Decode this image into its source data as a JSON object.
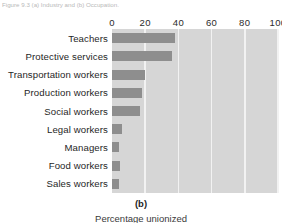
{
  "figure": {
    "caption_top": "Figure 9.3 (a) Industry and (b) Occupation.",
    "panel_label": "(b)",
    "axis_title_bottom": "Percentage unionized"
  },
  "chart_data": {
    "type": "bar",
    "orientation": "horizontal",
    "title": "",
    "subtitle": "",
    "xlabel": "Percentage unionized",
    "ylabel": "",
    "xlim": [
      0,
      100
    ],
    "xticks": [
      0,
      20,
      40,
      60,
      80,
      100
    ],
    "grid": true,
    "grid_axis": "x",
    "legend": false,
    "legend_position": "none",
    "categories": [
      "Teachers",
      "Protective services",
      "Transportation workers",
      "Production workers",
      "Social workers",
      "Legal workers",
      "Managers",
      "Food workers",
      "Sales workers"
    ],
    "values": [
      38,
      36,
      20,
      18,
      17,
      6,
      4,
      5,
      4
    ],
    "series": [
      {
        "name": "Percentage unionized",
        "values": [
          38,
          36,
          20,
          18,
          17,
          6,
          4,
          5,
          4
        ]
      }
    ]
  },
  "colors": {
    "bar": "#8e8e8e",
    "plot_background": "#d6d6d6",
    "gridline": "#f2f2f2",
    "page_background": "#ffffff",
    "text": "#1f1f1f"
  }
}
